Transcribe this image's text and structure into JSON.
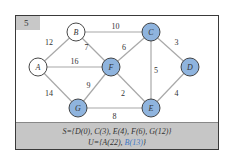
{
  "step": "5",
  "colors": {
    "visited_fill": "#8fb4de",
    "unvisited_fill": "#ffffff",
    "edge": "#a8a8a8",
    "highlight_text": "#3e78c4"
  },
  "nodes": [
    {
      "id": "A",
      "visited": false
    },
    {
      "id": "B",
      "visited": false
    },
    {
      "id": "C",
      "visited": true
    },
    {
      "id": "D",
      "visited": true
    },
    {
      "id": "E",
      "visited": true
    },
    {
      "id": "F",
      "visited": true
    },
    {
      "id": "G",
      "visited": true
    }
  ],
  "edges": [
    {
      "from": "A",
      "to": "B",
      "weight": "12"
    },
    {
      "from": "B",
      "to": "C",
      "weight": "10"
    },
    {
      "from": "B",
      "to": "F",
      "weight": "7"
    },
    {
      "from": "A",
      "to": "F",
      "weight": "16"
    },
    {
      "from": "A",
      "to": "G",
      "weight": "14"
    },
    {
      "from": "F",
      "to": "C",
      "weight": "6"
    },
    {
      "from": "C",
      "to": "D",
      "weight": "3"
    },
    {
      "from": "C",
      "to": "E",
      "weight": "5"
    },
    {
      "from": "F",
      "to": "E",
      "weight": "2"
    },
    {
      "from": "G",
      "to": "F",
      "weight": "9"
    },
    {
      "from": "G",
      "to": "E",
      "weight": "8"
    },
    {
      "from": "E",
      "to": "D",
      "weight": "4"
    }
  ],
  "sets": {
    "S": "S={D(0),  C(3),  E(4),  F(6),  G(12)}",
    "U_prefix": "U={A(22),  ",
    "U_highlight": "B(13)",
    "U_suffix": "}"
  }
}
